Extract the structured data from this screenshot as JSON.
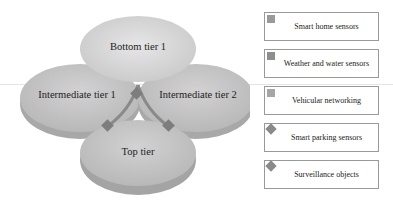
{
  "diagram": {
    "tiers": [
      {
        "id": "bottom-tier-1",
        "label": "Bottom tier 1"
      },
      {
        "id": "intermediate-tier-1",
        "label": "Intermediate tier 1"
      },
      {
        "id": "intermediate-tier-2",
        "label": "Intermediate tier 2"
      },
      {
        "id": "top-tier",
        "label": "Top tier"
      }
    ],
    "colors": {
      "disc_fill": "#c6c6c6",
      "disc_top_light": "#e3e3e3",
      "disc_side": "#9e9e9e",
      "connector": "#7f7f7f"
    }
  },
  "legend": {
    "items": [
      {
        "label": "Smart home sensors",
        "marker": "square"
      },
      {
        "label": "Weather and water sensors",
        "marker": "square"
      },
      {
        "label": "Vehicular networking",
        "marker": "square"
      },
      {
        "label": "Smart parking sensors",
        "marker": "diamond"
      },
      {
        "label": "Surveillance objects",
        "marker": "diamond"
      }
    ]
  }
}
